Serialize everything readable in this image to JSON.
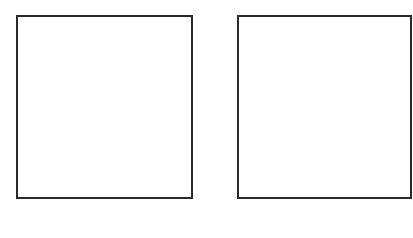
{
  "diagram": {
    "stroke_color": "#2a2a2a",
    "background_color": "#ffffff",
    "boxes": [
      {
        "id": "left",
        "label": ""
      },
      {
        "id": "right",
        "label": ""
      }
    ]
  }
}
